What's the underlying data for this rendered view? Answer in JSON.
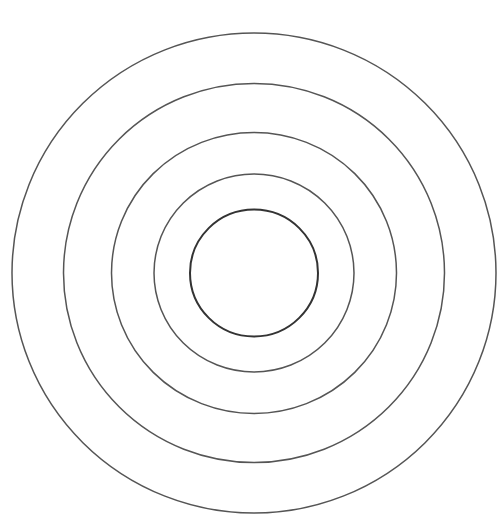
{
  "diagram": {
    "type": "concentric-circles",
    "background": "#ffffff",
    "center": {
      "x": 254,
      "y": 273
    },
    "circles": [
      {
        "id": "ring-1",
        "rx": 64,
        "ry": 63.5,
        "stroke": "#333333",
        "stroke_width": 2
      },
      {
        "id": "ring-2",
        "rx": 100,
        "ry": 99,
        "stroke": "#555555",
        "stroke_width": 1.5
      },
      {
        "id": "ring-3",
        "rx": 142.5,
        "ry": 140.5,
        "stroke": "#555555",
        "stroke_width": 1.5
      },
      {
        "id": "ring-4",
        "rx": 190.5,
        "ry": 189.5,
        "stroke": "#555555",
        "stroke_width": 1.5
      },
      {
        "id": "ring-5",
        "rx": 242,
        "ry": 240,
        "stroke": "#555555",
        "stroke_width": 1.5
      }
    ]
  }
}
